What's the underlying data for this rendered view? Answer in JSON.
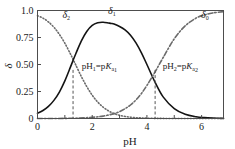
{
  "chart_data": {
    "type": "line",
    "title": "",
    "xlabel": "pH",
    "ylabel": "δ",
    "xlim": [
      0,
      6.8
    ],
    "ylim": [
      0,
      1.0
    ],
    "grid": false,
    "legend_position": "inline-curve-labels",
    "x_ticks": [
      0,
      1,
      2,
      3,
      4,
      5,
      6
    ],
    "x_tick_labels": [
      "0",
      "",
      "2",
      "",
      "4",
      "",
      "6"
    ],
    "y_ticks": [
      0,
      0.25,
      0.5,
      0.75,
      1.0
    ],
    "y_tick_labels": [
      "0",
      "0.25",
      "0.50",
      "0.75",
      "1.0"
    ],
    "series": [
      {
        "name": "δ2",
        "label_base": "δ",
        "label_sub": "2",
        "style": "dotted",
        "color": "#6b6b6b",
        "label_x": 1.05,
        "label_y": 0.935,
        "x": [
          0,
          0.2,
          0.4,
          0.6,
          0.8,
          1.0,
          1.2,
          1.3,
          1.4,
          1.6,
          1.8,
          2.0,
          2.2,
          2.4,
          2.6,
          2.8,
          3.0,
          3.2,
          3.4,
          3.6,
          3.8,
          4.0,
          4.3,
          4.6,
          5.0,
          5.5,
          6.0,
          6.5,
          6.8
        ],
        "y": [
          0.952,
          0.929,
          0.894,
          0.845,
          0.779,
          0.697,
          0.6,
          0.548,
          0.495,
          0.39,
          0.296,
          0.216,
          0.153,
          0.105,
          0.07,
          0.046,
          0.03,
          0.019,
          0.012,
          0.0077,
          0.0048,
          0.003,
          0.0015,
          0.0007,
          0.0003,
          0.0001,
          3e-05,
          1e-05,
          5e-06
        ]
      },
      {
        "name": "δ1",
        "label_base": "δ",
        "label_sub": "1",
        "style": "solid",
        "color": "#141414",
        "label_x": 2.72,
        "label_y": 0.965,
        "x": [
          0,
          0.2,
          0.4,
          0.6,
          0.8,
          1.0,
          1.2,
          1.3,
          1.4,
          1.6,
          1.8,
          2.0,
          2.2,
          2.4,
          2.6,
          2.7,
          2.8,
          3.0,
          3.2,
          3.4,
          3.6,
          3.8,
          4.0,
          4.3,
          4.6,
          5.0,
          5.4,
          5.8,
          6.1,
          6.4,
          6.8
        ],
        "y": [
          0.048,
          0.074,
          0.112,
          0.168,
          0.245,
          0.348,
          0.473,
          0.538,
          0.6,
          0.717,
          0.806,
          0.862,
          0.887,
          0.891,
          0.884,
          0.88,
          0.874,
          0.852,
          0.82,
          0.771,
          0.7,
          0.608,
          0.5,
          0.335,
          0.198,
          0.092,
          0.039,
          0.016,
          0.008,
          0.004,
          0.0016
        ]
      },
      {
        "name": "δ0",
        "label_base": "δ",
        "label_sub": "0",
        "style": "dashdot",
        "color": "#6b6b6b",
        "label_x": 6.12,
        "label_y": 0.935,
        "x": [
          0,
          0.5,
          1.0,
          1.5,
          2.0,
          2.4,
          2.8,
          3.0,
          3.2,
          3.4,
          3.6,
          3.8,
          4.0,
          4.3,
          4.6,
          5.0,
          5.4,
          5.8,
          6.1,
          6.4,
          6.8
        ],
        "y": [
          0.0001,
          0.0003,
          0.0012,
          0.0038,
          0.0108,
          0.0223,
          0.045,
          0.064,
          0.09,
          0.125,
          0.172,
          0.232,
          0.306,
          0.432,
          0.567,
          0.738,
          0.858,
          0.93,
          0.959,
          0.977,
          0.99
        ]
      }
    ],
    "vertical_lines": [
      {
        "name": "pka1-line",
        "x": 1.3,
        "y_top": 0.45,
        "y_bottom": 0
      },
      {
        "name": "pka2-line",
        "x": 4.3,
        "y_top": 0.45,
        "y_bottom": 0
      }
    ],
    "annotations": [
      {
        "name": "pka1-annotation",
        "text": "pH₁=pKₐ₁",
        "parts": {
          "p1": "pH",
          "sub1": "1",
          "eq": "=p",
          "k": "K",
          "sub2": "a",
          "sub3": "1"
        },
        "x": 1.62,
        "y": 0.455
      },
      {
        "name": "pka2-annotation",
        "text": "pH₂=pKₐ₂",
        "parts": {
          "p1": "pH",
          "sub1": "2",
          "eq": "=p",
          "k": "K",
          "sub2": "a",
          "sub3": "2"
        },
        "x": 4.58,
        "y": 0.455
      }
    ],
    "colors": {
      "frame": "#4d4d4d",
      "solid_curve": "#141414",
      "dotted_curve": "#6b6b6b",
      "dashdot_curve": "#6b6b6b",
      "dashed_vline": "#555555",
      "text": "#1a1a1a",
      "background": "#ffffff"
    }
  }
}
